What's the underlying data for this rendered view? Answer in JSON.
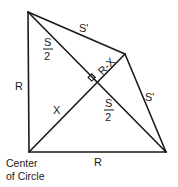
{
  "diagram": {
    "labels": {
      "s_prime_top": "S'",
      "s_prime_right": "S'",
      "s_half_top_num": "S",
      "s_half_top_den": "2",
      "s_half_bottom_num": "S",
      "s_half_bottom_den": "2",
      "r_minus_x": "R-X",
      "x": "X",
      "r_left": "R",
      "r_bottom": "R"
    },
    "caption": {
      "line1": "Center",
      "line2": "of Circle"
    },
    "colors": {
      "stroke": "#1a1a1a",
      "background": "#ffffff"
    }
  }
}
